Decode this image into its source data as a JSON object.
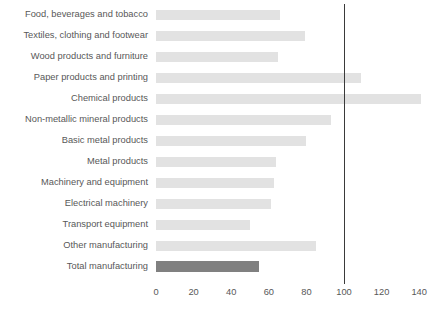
{
  "chart_data": {
    "type": "bar",
    "orientation": "horizontal",
    "title": "",
    "subtitle": "",
    "xlabel": "",
    "ylabel": "",
    "xlim": [
      0,
      145
    ],
    "grid": false,
    "legend": "none",
    "reference_line": {
      "value": 100,
      "label": "100",
      "color": "#3a3a3a"
    },
    "colors": {
      "bar": "#e2e2e2",
      "highlight_bar": "#808080",
      "text": "#585858",
      "background": "#ffffff"
    },
    "xticks": [
      0,
      20,
      40,
      60,
      80,
      100,
      120,
      140
    ],
    "xtick_labels": [
      "0",
      "20",
      "40",
      "60",
      "80",
      "100",
      "120",
      "140"
    ],
    "categories": [
      "Food, beverages and tobacco",
      "Textiles, clothing and footwear",
      "Wood products and furniture",
      "Paper products and printing",
      "Chemical products",
      "Non-metallic mineral products",
      "Basic metal products",
      "Metal products",
      "Machinery and equipment",
      "Electrical machinery",
      "Transport equipment",
      "Other manufacturing",
      "Total manufacturing"
    ],
    "values": [
      66,
      79,
      65,
      109,
      141,
      93,
      80,
      64,
      63,
      61,
      50,
      85,
      55
    ],
    "highlight_index": 12,
    "series": [
      {
        "name": "Index",
        "values": [
          66,
          79,
          65,
          109,
          141,
          93,
          80,
          64,
          63,
          61,
          50,
          85,
          55
        ]
      }
    ]
  }
}
